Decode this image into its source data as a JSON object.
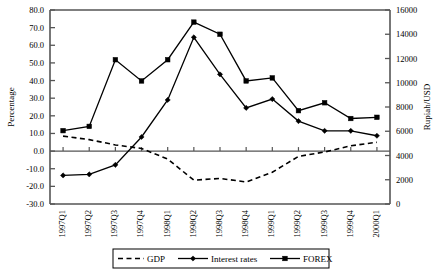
{
  "chart_data": {
    "type": "line",
    "title": "",
    "xlabel": "",
    "ylabel": "Percentage",
    "y2label": "Rupiah/USD",
    "categories": [
      "1997Q1",
      "1997Q2",
      "1997Q3",
      "1997Q4",
      "1998Q1",
      "1998Q2",
      "1998Q3",
      "1998Q4",
      "1999Q1",
      "1999Q2",
      "1999Q3",
      "1999Q4",
      "2000Q1"
    ],
    "ylim": [
      -30.0,
      80.0
    ],
    "ytick_labels": [
      "80.0",
      "70.0",
      "60.0",
      "50.0",
      "40.0",
      "30.0",
      "20.0",
      "10.0",
      "0.0",
      "-10.0",
      "-20.0",
      "-30.0"
    ],
    "ytick_values": [
      80.0,
      70.0,
      60.0,
      50.0,
      40.0,
      30.0,
      20.0,
      10.0,
      0.0,
      -10.0,
      -20.0,
      -30.0
    ],
    "y2lim": [
      0,
      16000
    ],
    "y2tick_labels": [
      "16000",
      "14000",
      "12000",
      "10000",
      "8000",
      "6000",
      "4000",
      "2000",
      "0"
    ],
    "y2tick_values": [
      16000,
      14000,
      12000,
      10000,
      8000,
      6000,
      4000,
      2000,
      0
    ],
    "grid": false,
    "legend_position": "bottom",
    "series": [
      {
        "name": "GDP",
        "axis": "left",
        "unit": "percent",
        "style": "dashed",
        "marker": "none",
        "values": [
          8.5,
          6.5,
          3.5,
          1.5,
          -4.5,
          -16.5,
          -15.5,
          -17.5,
          -12.0,
          -3.0,
          -0.5,
          3.0,
          5.0
        ]
      },
      {
        "name": "Interest rates",
        "axis": "left",
        "unit": "percent",
        "style": "solid",
        "marker": "diamond",
        "values": [
          -13.8,
          -13.2,
          -7.8,
          8.0,
          29.0,
          64.5,
          43.5,
          24.5,
          29.5,
          17.0,
          11.5,
          11.5,
          8.7
        ]
      },
      {
        "name": "FOREX",
        "axis": "right",
        "unit": "rupiah",
        "style": "solid",
        "marker": "square",
        "values": [
          6050,
          6400,
          11900,
          10150,
          11900,
          15000,
          14000,
          10150,
          10400,
          7700,
          8350,
          7050,
          7150
        ]
      }
    ]
  },
  "legend": {
    "items": [
      {
        "label": "GDP",
        "style": "dashed",
        "marker": "none"
      },
      {
        "label": "Interest rates",
        "style": "solid",
        "marker": "diamond"
      },
      {
        "label": "FOREX",
        "style": "solid",
        "marker": "square"
      }
    ]
  }
}
